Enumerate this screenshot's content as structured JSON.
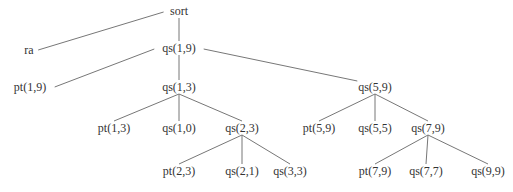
{
  "diagram": {
    "type": "tree",
    "line_color": "#777777",
    "text_color": "#333333",
    "nodes": [
      {
        "id": "sort",
        "label": "sort",
        "x": 179,
        "y": 11
      },
      {
        "id": "ra",
        "label": "ra",
        "x": 29,
        "y": 50
      },
      {
        "id": "qs19",
        "label": "qs(1,9)",
        "x": 179,
        "y": 48
      },
      {
        "id": "pt19",
        "label": "pt(1,9)",
        "x": 30,
        "y": 87
      },
      {
        "id": "qs13",
        "label": "qs(1,3)",
        "x": 179,
        "y": 87
      },
      {
        "id": "qs59",
        "label": "qs(5,9)",
        "x": 375,
        "y": 87
      },
      {
        "id": "pt13",
        "label": "pt(1,3)",
        "x": 114,
        "y": 128
      },
      {
        "id": "qs10",
        "label": "qs(1,0)",
        "x": 179,
        "y": 128
      },
      {
        "id": "qs23",
        "label": "qs(2,3)",
        "x": 242,
        "y": 128
      },
      {
        "id": "pt59",
        "label": "pt(5,9)",
        "x": 319,
        "y": 128
      },
      {
        "id": "qs55",
        "label": "qs(5,5)",
        "x": 375,
        "y": 128
      },
      {
        "id": "qs79",
        "label": "qs(7,9)",
        "x": 428,
        "y": 128
      },
      {
        "id": "pt23",
        "label": "pt(2,3)",
        "x": 179,
        "y": 171
      },
      {
        "id": "qs21",
        "label": "qs(2,1)",
        "x": 242,
        "y": 171
      },
      {
        "id": "qs33",
        "label": "qs(3,3)",
        "x": 290,
        "y": 171
      },
      {
        "id": "pt79",
        "label": "pt(7,9)",
        "x": 375,
        "y": 171
      },
      {
        "id": "qs77",
        "label": "qs(7,7)",
        "x": 426,
        "y": 171
      },
      {
        "id": "qs99",
        "label": "qs(9,9)",
        "x": 488,
        "y": 171
      }
    ],
    "edges": [
      [
        "sort",
        "ra"
      ],
      [
        "sort",
        "qs19"
      ],
      [
        "qs19",
        "pt19"
      ],
      [
        "qs19",
        "qs13"
      ],
      [
        "qs19",
        "qs59"
      ],
      [
        "qs13",
        "pt13"
      ],
      [
        "qs13",
        "qs10"
      ],
      [
        "qs13",
        "qs23"
      ],
      [
        "qs59",
        "pt59"
      ],
      [
        "qs59",
        "qs55"
      ],
      [
        "qs59",
        "qs79"
      ],
      [
        "qs23",
        "pt23"
      ],
      [
        "qs23",
        "qs21"
      ],
      [
        "qs23",
        "qs33"
      ],
      [
        "qs79",
        "pt79"
      ],
      [
        "qs79",
        "qs77"
      ],
      [
        "qs79",
        "qs99"
      ]
    ]
  }
}
